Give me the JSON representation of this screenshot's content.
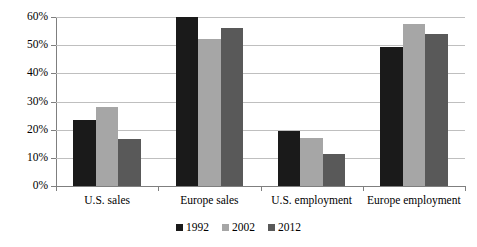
{
  "chart_data": {
    "type": "bar",
    "title": "",
    "subtitle": "",
    "xlabel": "",
    "ylabel": "",
    "categories": [
      "U.S. sales",
      "Europe sales",
      "U.S. employment",
      "Europe employment"
    ],
    "series": [
      {
        "name": "1992",
        "color": "#1a1a1a",
        "values": [
          23.5,
          60.0,
          19.6,
          49.5
        ]
      },
      {
        "name": "2002",
        "color": "#a6a6a6",
        "values": [
          28.0,
          52.3,
          17.2,
          57.6
        ]
      },
      {
        "name": "2012",
        "color": "#595959",
        "values": [
          16.6,
          56.0,
          11.4,
          54.0
        ]
      }
    ],
    "ylim": [
      0,
      60
    ],
    "ytick_values": [
      0,
      10,
      20,
      30,
      40,
      50,
      60
    ],
    "ytick_labels": [
      "0%",
      "10%",
      "20%",
      "30%",
      "40%",
      "50%",
      "60%"
    ],
    "grid": true,
    "grid_axis": "y",
    "legend_position": "bottom",
    "value_suffix": "%"
  }
}
